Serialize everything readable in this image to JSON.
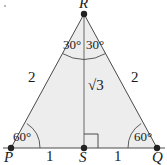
{
  "figure": {
    "type": "geometry-diagram",
    "stroke_color": "#4a4a4a",
    "fill_color": "#ededed",
    "text_color": "#1a1a1a",
    "vertices": [
      {
        "name": "R",
        "label": "R",
        "x": 84,
        "y": 14,
        "role": "apex"
      },
      {
        "name": "P",
        "label": "P",
        "x": 11,
        "y": 148,
        "role": "base-left"
      },
      {
        "name": "Q",
        "label": "Q",
        "x": 157,
        "y": 148,
        "role": "base-right"
      },
      {
        "name": "S",
        "label": "S",
        "x": 84,
        "y": 148,
        "role": "base-midpoint-foot"
      }
    ],
    "angles": [
      {
        "at": "R",
        "side": "left",
        "label": "30°"
      },
      {
        "at": "R",
        "side": "right",
        "label": "30°"
      },
      {
        "at": "P",
        "side": "interior",
        "label": "60°"
      },
      {
        "at": "Q",
        "side": "interior",
        "label": "60°"
      },
      {
        "at": "S",
        "side": "interior",
        "label": "right-angle-square"
      }
    ],
    "side_lengths": [
      {
        "segment": "PR",
        "label": "2"
      },
      {
        "segment": "QR",
        "label": "2"
      },
      {
        "segment": "RS",
        "label": "√3"
      },
      {
        "segment": "PS",
        "label": "1"
      },
      {
        "segment": "SQ",
        "label": "1"
      }
    ]
  }
}
